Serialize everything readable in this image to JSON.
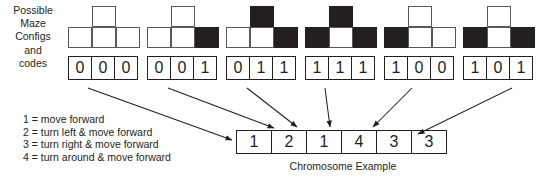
{
  "figure": {
    "left_label_lines": [
      "Possible",
      "Maze",
      "Configs",
      "and",
      "codes"
    ],
    "caption": "Chromosome Example"
  },
  "maze_configs": [
    {
      "code": "000",
      "bits": [
        "0",
        "0",
        "0"
      ],
      "cells": {
        "top": "white",
        "bottom_left": "white",
        "bottom_center": "white",
        "bottom_right": "white"
      }
    },
    {
      "code": "001",
      "bits": [
        "0",
        "0",
        "1"
      ],
      "cells": {
        "top": "white",
        "bottom_left": "white",
        "bottom_center": "white",
        "bottom_right": "black"
      }
    },
    {
      "code": "011",
      "bits": [
        "0",
        "1",
        "1"
      ],
      "cells": {
        "top": "black",
        "bottom_left": "white",
        "bottom_center": "white",
        "bottom_right": "black"
      }
    },
    {
      "code": "111",
      "bits": [
        "1",
        "1",
        "1"
      ],
      "cells": {
        "top": "black",
        "bottom_left": "black",
        "bottom_center": "white",
        "bottom_right": "black"
      }
    },
    {
      "code": "100",
      "bits": [
        "1",
        "0",
        "0"
      ],
      "cells": {
        "top": "white",
        "bottom_left": "black",
        "bottom_center": "white",
        "bottom_right": "white"
      }
    },
    {
      "code": "101",
      "bits": [
        "1",
        "0",
        "1"
      ],
      "cells": {
        "top": "white",
        "bottom_left": "black",
        "bottom_center": "white",
        "bottom_right": "black"
      }
    }
  ],
  "legend": {
    "rules": [
      "1 = move forward",
      "2 = turn left & move forward",
      "3 = turn right & move forward",
      "4 = turn around & move forward"
    ]
  },
  "chromosome": {
    "genes": [
      "1",
      "2",
      "1",
      "4",
      "3",
      "3"
    ]
  },
  "colors": {
    "wall": "#231f20",
    "open": "#ffffff",
    "stroke": "#58595b",
    "text": "#231f20"
  }
}
